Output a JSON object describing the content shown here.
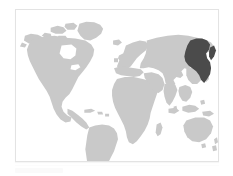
{
  "figure": {
    "type": "locator-map",
    "caption": ""
  },
  "map": {
    "projection": "equirectangular",
    "background_color": "#ffffff",
    "land_color": "#c9c9c9",
    "highlight_color": "#4b4b4b",
    "border_color": "#e3e3e3",
    "highlighted_region": "Russian Far East",
    "regions": [
      {
        "name": "North America",
        "state": "normal"
      },
      {
        "name": "South America",
        "state": "normal"
      },
      {
        "name": "Greenland",
        "state": "normal"
      },
      {
        "name": "Europe",
        "state": "normal"
      },
      {
        "name": "Africa",
        "state": "normal"
      },
      {
        "name": "Asia",
        "state": "normal"
      },
      {
        "name": "Russian Far East",
        "state": "highlighted"
      },
      {
        "name": "Australia",
        "state": "normal"
      },
      {
        "name": "New Zealand",
        "state": "normal"
      },
      {
        "name": "Japan",
        "state": "normal"
      },
      {
        "name": "Indonesia",
        "state": "normal"
      },
      {
        "name": "Madagascar",
        "state": "normal"
      },
      {
        "name": "Iceland",
        "state": "normal"
      },
      {
        "name": "United Kingdom",
        "state": "normal"
      },
      {
        "name": "Sri Lanka",
        "state": "normal"
      },
      {
        "name": "Cuba",
        "state": "normal"
      },
      {
        "name": "Philippines",
        "state": "normal"
      },
      {
        "name": "Papua New Guinea",
        "state": "normal"
      }
    ]
  },
  "caption_placeholder": {
    "visible": true,
    "text": ""
  }
}
